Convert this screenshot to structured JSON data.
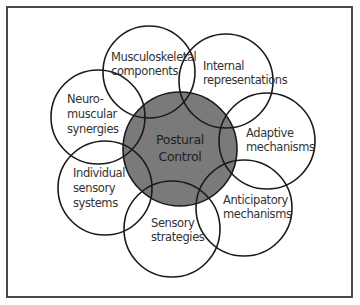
{
  "diagram": {
    "center": {
      "line1": "Postural",
      "line2": "Control",
      "fill": "#7a7a7a"
    },
    "satellites": [
      {
        "id": "musculoskeletal",
        "line1": "Musculoskeletal",
        "line2": "components",
        "line3": ""
      },
      {
        "id": "internal",
        "line1": "Internal",
        "line2": "representations",
        "line3": ""
      },
      {
        "id": "adaptive",
        "line1": "Adaptive",
        "line2": "mechanisms",
        "line3": ""
      },
      {
        "id": "anticipatory",
        "line1": "Anticipatory",
        "line2": "mechanisms",
        "line3": ""
      },
      {
        "id": "sensory-strategies",
        "line1": "Sensory",
        "line2": "strategies",
        "line3": ""
      },
      {
        "id": "individual",
        "line1": "Individual",
        "line2": "sensory",
        "line3": "systems"
      },
      {
        "id": "neuromuscular",
        "line1": "Neuro-",
        "line2": "muscular",
        "line3": "synergies"
      }
    ],
    "colors": {
      "stroke": "#1a1a1a",
      "frame": "#4a4a4a",
      "text": "#333333"
    }
  }
}
